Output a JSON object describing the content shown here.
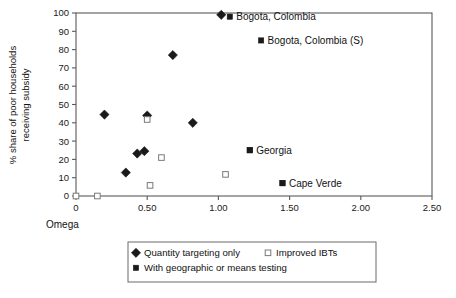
{
  "chart_data": {
    "type": "scatter",
    "title": "",
    "xlabel": "Omega",
    "ylabel": "% share of poor households receiving subsidy",
    "ylabel_line1": "% share of poor households",
    "ylabel_line2": "receiving subsidy",
    "xlim": [
      0,
      2.5
    ],
    "ylim": [
      0,
      100
    ],
    "grid": false,
    "xticks": [
      0,
      0.5,
      1.0,
      1.5,
      2.0,
      2.5
    ],
    "xticklabels": [
      "0",
      "0.50",
      "1.00",
      "1.50",
      "2.00",
      "2.50"
    ],
    "yticks": [
      0,
      10,
      20,
      30,
      40,
      50,
      60,
      70,
      80,
      90,
      100
    ],
    "yticklabels": [
      "0",
      "10",
      "20",
      "30",
      "40",
      "50",
      "60",
      "70",
      "80",
      "90",
      "100"
    ],
    "legend_position": "below-axes",
    "series": [
      {
        "name": "Quantity targeting only",
        "marker": "diamond-filled",
        "color": "#1a1a1a",
        "points": [
          {
            "x": 0.2,
            "y": 44.5
          },
          {
            "x": 0.35,
            "y": 12.8
          },
          {
            "x": 0.43,
            "y": 23.2
          },
          {
            "x": 0.48,
            "y": 24.5
          },
          {
            "x": 0.5,
            "y": 44.0
          },
          {
            "x": 0.68,
            "y": 77.0
          },
          {
            "x": 0.82,
            "y": 40.0
          },
          {
            "x": 1.02,
            "y": 99.0
          }
        ]
      },
      {
        "name": "Improved IBTs",
        "marker": "square-open",
        "color": "#7a7a7a",
        "points": [
          {
            "x": 0.0,
            "y": 0.0
          },
          {
            "x": 0.15,
            "y": 0.0
          },
          {
            "x": 0.5,
            "y": 41.8
          },
          {
            "x": 0.52,
            "y": 5.8
          },
          {
            "x": 0.6,
            "y": 21.0
          },
          {
            "x": 1.05,
            "y": 11.8
          }
        ]
      },
      {
        "name": "With geographic or means testing",
        "marker": "square-filled",
        "color": "#1a1a1a",
        "points": [
          {
            "x": 1.22,
            "y": 25.0
          },
          {
            "x": 1.45,
            "y": 7.0
          }
        ]
      }
    ],
    "annotations": [
      {
        "label": "Bogota, Colombia",
        "marker": "square-filled",
        "x": 1.08,
        "y": 98.0
      },
      {
        "label": "Bogota, Colombia (S)",
        "marker": "square-filled",
        "x": 1.3,
        "y": 85.0
      },
      {
        "label": "Georgia",
        "marker": "square-filled",
        "x": 1.22,
        "y": 25.0
      },
      {
        "label": "Cape Verde",
        "marker": "square-filled",
        "x": 1.45,
        "y": 7.0
      }
    ]
  },
  "legend": {
    "entries": [
      {
        "label": "Quantity targeting only",
        "marker": "diamond-filled"
      },
      {
        "label": "Improved IBTs",
        "marker": "square-open"
      },
      {
        "label": "With geographic or means testing",
        "marker": "square-filled"
      }
    ]
  },
  "colors": {
    "marker_dark": "#1a1a1a",
    "marker_open_stroke": "#7a7a7a",
    "axis": "#595959",
    "background": "#ffffff"
  }
}
